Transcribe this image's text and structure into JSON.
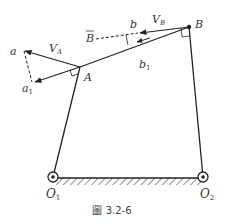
{
  "figure": {
    "caption": "圖 3.2-6",
    "type": "four-bar linkage velocity diagram"
  },
  "labels": {
    "a": "a",
    "a1_main": "a",
    "a1_sub": "1",
    "VA_main": "V",
    "VA_sub": "A",
    "A": "A",
    "B": "B",
    "Bbar": "B",
    "b": "b",
    "b1_main": "b",
    "b1_sub": "1",
    "VB_main": "V",
    "VB_sub": "B",
    "O1_main": "O",
    "O1_sub": "1",
    "O2_main": "O",
    "O2_sub": "2"
  },
  "colors": {
    "line": "#222222",
    "hatch": "#555555",
    "text": "#333333"
  }
}
